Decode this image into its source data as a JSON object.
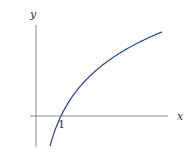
{
  "chart_data": {
    "type": "line",
    "title": "",
    "function": "y = ln(x)",
    "xlabel": "x",
    "ylabel": "y",
    "tick_labels": [
      "1"
    ],
    "annotations": [
      {
        "text": "1",
        "x": 1,
        "y": 0
      }
    ],
    "series": [
      {
        "name": "ln(x)",
        "color": "#3a4f8c",
        "x": [
          0.56,
          0.75,
          1.0,
          1.5,
          2.0,
          2.5,
          3.0,
          3.5,
          4.0,
          4.5,
          5.04
        ],
        "values": [
          -0.58,
          -0.29,
          0.0,
          0.41,
          0.69,
          0.92,
          1.1,
          1.25,
          1.39,
          1.5,
          1.62
        ]
      }
    ],
    "xlim": [
      -0.25,
      5.3
    ],
    "ylim": [
      -0.6,
      1.75
    ],
    "grid": false,
    "legend": "none"
  },
  "axes": {
    "x_label": "x",
    "y_label": "y",
    "tick_one": "1",
    "axis_color": "#888888",
    "curve_color": "#3a4f8c"
  }
}
